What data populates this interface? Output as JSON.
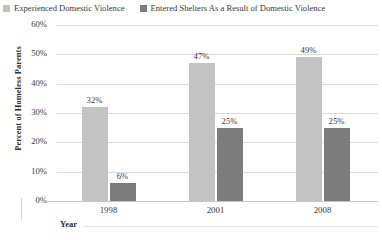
{
  "legend": {
    "items": [
      {
        "label": "Experienced Domestic Violence",
        "color": "#c3c3c3",
        "swatch_icon": "legend-swatch-icon"
      },
      {
        "label": "Entered Shelters As a Result of Domestic Violence",
        "color": "#7c7c7c",
        "swatch_icon": "legend-swatch-icon"
      }
    ]
  },
  "chart_data": {
    "type": "bar",
    "title": "",
    "xlabel": "Year",
    "ylabel": "Percent of Homeless Parents",
    "categories": [
      "1998",
      "2001",
      "2008"
    ],
    "series": [
      {
        "name": "Experienced Domestic Violence",
        "color": "#c3c3c3",
        "values": [
          32,
          47,
          49
        ],
        "labels": [
          "32%",
          "47%",
          "49%"
        ]
      },
      {
        "name": "Entered Shelters As a Result of Domestic Violence",
        "color": "#7c7c7c",
        "values": [
          6,
          25,
          25
        ],
        "labels": [
          "6%",
          "25%",
          "25%"
        ]
      }
    ],
    "ylim": [
      0,
      60
    ],
    "yticks": [
      0,
      10,
      20,
      30,
      40,
      50,
      60
    ],
    "ytick_labels": [
      "0%",
      "10%",
      "20%",
      "30%",
      "40%",
      "50%",
      "60%"
    ],
    "grid": true,
    "legend_position": "top",
    "background": "#ffffff",
    "gridline_color": "#dcdcdc"
  }
}
